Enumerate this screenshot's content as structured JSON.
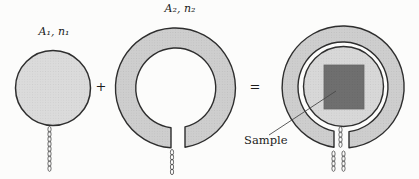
{
  "figure": {
    "background": "#fcfcfb",
    "labels": {
      "coil1": "A₁, n₁",
      "coil2": "A₂, n₂",
      "plus": "+",
      "equals": "=",
      "sample": "Sample"
    },
    "colors": {
      "outline": "#2e2e2e",
      "coil1_fill": "#dbdbdb",
      "coil1_dot": "#c9c9c9",
      "ring_fill": "#cecece",
      "ring_dot": "#bcbcbc",
      "inner_fill": "#d8d8d8",
      "inner_dot": "#c6c6c6",
      "sample_fill": "#6f6f6f",
      "sample_dot": "#666666",
      "wire": "#3d3d3d",
      "leader": "#4a4a4a"
    }
  }
}
